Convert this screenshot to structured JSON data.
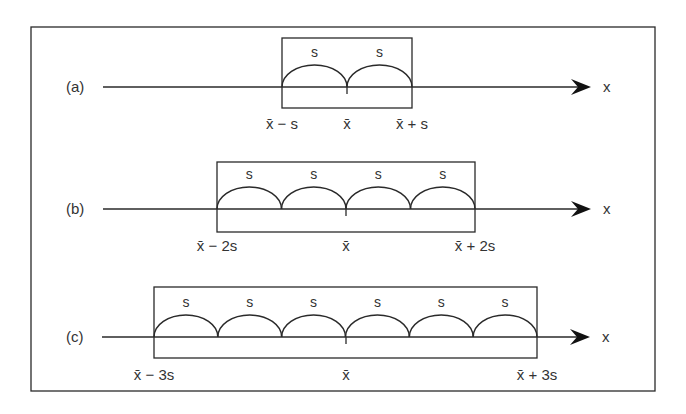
{
  "figure": {
    "frame": {
      "left": 31,
      "top": 27,
      "right": 655,
      "bottom": 391
    },
    "stroke_color": "#2a2a2a",
    "text_color": "#333333",
    "axis_label": "x",
    "segment_label": "s"
  },
  "panels": [
    {
      "id": "a",
      "label": "(a)",
      "axis_y": 87,
      "axis_start": 103,
      "arrow_tip": 591,
      "box": {
        "left": 282,
        "right": 412,
        "top": 38,
        "bottom": 108
      },
      "center": 347,
      "segments": 2,
      "label_y": 129,
      "ticks": [
        {
          "text": "x̄ − s",
          "x": 282
        },
        {
          "text": "x̄",
          "x": 347
        },
        {
          "text": "x̄ + s",
          "x": 412
        }
      ]
    },
    {
      "id": "b",
      "label": "(b)",
      "axis_y": 209,
      "axis_start": 103,
      "arrow_tip": 591,
      "box": {
        "left": 217,
        "right": 475,
        "top": 162,
        "bottom": 232
      },
      "center": 346,
      "segments": 4,
      "label_y": 251,
      "ticks": [
        {
          "text": "x̄ − 2s",
          "x": 217
        },
        {
          "text": "x̄",
          "x": 346
        },
        {
          "text": "x̄ + 2s",
          "x": 475
        }
      ]
    },
    {
      "id": "c",
      "label": "(c)",
      "axis_y": 337,
      "axis_start": 102,
      "arrow_tip": 590,
      "box": {
        "left": 154,
        "right": 537,
        "top": 287,
        "bottom": 358
      },
      "center": 346,
      "segments": 6,
      "label_y": 380,
      "ticks": [
        {
          "text": "x̄ − 3s",
          "x": 154
        },
        {
          "text": "x̄",
          "x": 346
        },
        {
          "text": "x̄ + 3s",
          "x": 537
        }
      ]
    }
  ]
}
